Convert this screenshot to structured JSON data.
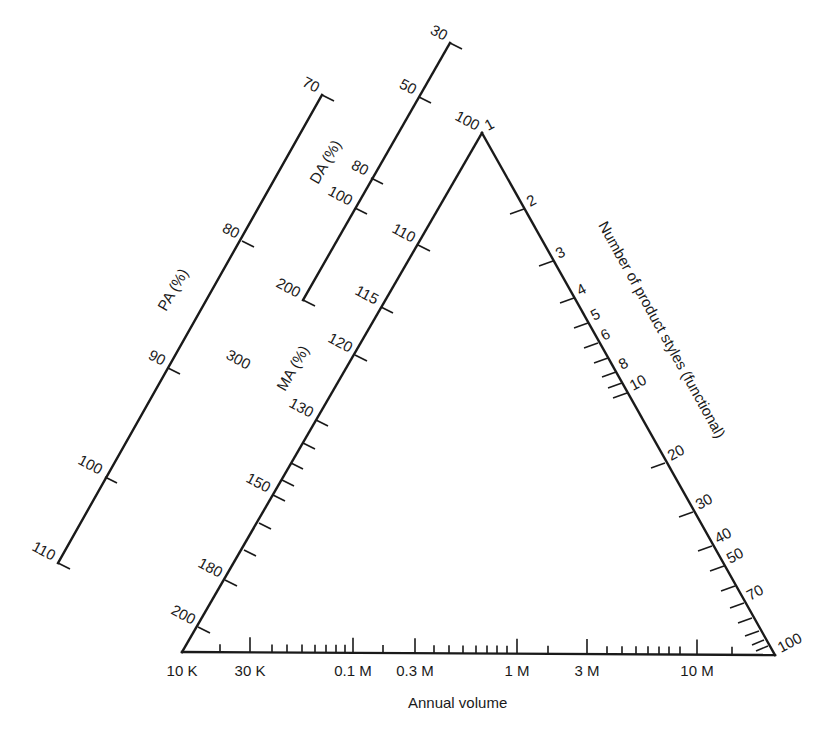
{
  "diagram": {
    "type": "nomogram",
    "colors": {
      "line": "#1a1a1a",
      "background": "#ffffff"
    },
    "scales": {
      "pa": {
        "title": "PA (%)",
        "ticks": [
          {
            "label": "70",
            "x": 322,
            "y": 95
          },
          {
            "label": "80",
            "x": 242,
            "y": 241
          },
          {
            "label": "90",
            "x": 168,
            "y": 368
          },
          {
            "label": "100",
            "x": 105,
            "y": 477
          },
          {
            "label": "110",
            "x": 58,
            "y": 563
          }
        ]
      },
      "da": {
        "title": "DA (%)",
        "ticks": [
          {
            "label": "30",
            "x": 450,
            "y": 43
          },
          {
            "label": "50",
            "x": 419,
            "y": 97
          },
          {
            "label": "80",
            "x": 371,
            "y": 178
          },
          {
            "label": "100",
            "x": 355,
            "y": 208
          },
          {
            "label": "200",
            "x": 303,
            "y": 300
          },
          {
            "label": "300",
            "x": 0,
            "y": 0
          }
        ]
      },
      "ma": {
        "title": "MA (%)",
        "ticks": [
          {
            "label": "100",
            "x": 482,
            "y": 133
          },
          {
            "label": "110",
            "x": 418,
            "y": 245
          },
          {
            "label": "115",
            "x": 381,
            "y": 307
          },
          {
            "label": "120",
            "x": 355,
            "y": 355
          },
          {
            "label": "130",
            "x": 316,
            "y": 420
          },
          {
            "label": "",
            "x": 303,
            "y": 443
          },
          {
            "label": "",
            "x": 291,
            "y": 463
          },
          {
            "label": "",
            "x": 282,
            "y": 480
          },
          {
            "label": "150",
            "x": 273,
            "y": 495
          },
          {
            "label": "",
            "x": 259,
            "y": 523
          },
          {
            "label": "",
            "x": 244,
            "y": 550
          },
          {
            "label": "180",
            "x": 225,
            "y": 580
          },
          {
            "label": "200",
            "x": 198,
            "y": 627
          }
        ]
      },
      "product_styles": {
        "title": "Number of product styles (functional)",
        "ticks": [
          {
            "label": "1",
            "x": 482,
            "y": 133
          },
          {
            "label": "2",
            "x": 524,
            "y": 209
          },
          {
            "label": "3",
            "x": 553,
            "y": 261
          },
          {
            "label": "4",
            "x": 574,
            "y": 298
          },
          {
            "label": "5",
            "x": 588,
            "y": 323
          },
          {
            "label": "6",
            "x": 598,
            "y": 343
          },
          {
            "label": "",
            "x": 608,
            "y": 358
          },
          {
            "label": "8",
            "x": 616,
            "y": 372
          },
          {
            "label": "",
            "x": 622,
            "y": 383
          },
          {
            "label": "10",
            "x": 627,
            "y": 393
          },
          {
            "label": "20",
            "x": 665,
            "y": 463
          },
          {
            "label": "30",
            "x": 693,
            "y": 512
          },
          {
            "label": "40",
            "x": 712,
            "y": 546
          },
          {
            "label": "50",
            "x": 724,
            "y": 566
          },
          {
            "label": "",
            "x": 735,
            "y": 586
          },
          {
            "label": "70",
            "x": 744,
            "y": 603
          },
          {
            "label": "",
            "x": 752,
            "y": 618
          },
          {
            "label": "",
            "x": 759,
            "y": 631
          },
          {
            "label": "100",
            "x": 775,
            "y": 655
          }
        ]
      },
      "annual_volume": {
        "title": "Annual volume",
        "major_ticks": [
          {
            "label": "10 K",
            "x": 182
          },
          {
            "label": "30 K",
            "x": 250
          },
          {
            "label": "0.1 M",
            "x": 353
          },
          {
            "label": "0.3 M",
            "x": 415
          },
          {
            "label": "1 M",
            "x": 517
          },
          {
            "label": "3 M",
            "x": 587
          },
          {
            "label": "10 M",
            "x": 697
          }
        ],
        "minor_ticks_x": [
          220,
          272,
          287,
          302,
          315,
          326,
          336,
          345,
          383,
          434,
          449,
          463,
          476,
          487,
          497,
          507,
          548,
          607,
          622,
          636,
          648,
          659,
          669,
          680,
          732
        ]
      }
    },
    "triangle": {
      "apex": [
        482,
        133
      ],
      "bottom_left": [
        182,
        652
      ],
      "bottom_right": [
        775,
        655
      ]
    }
  }
}
